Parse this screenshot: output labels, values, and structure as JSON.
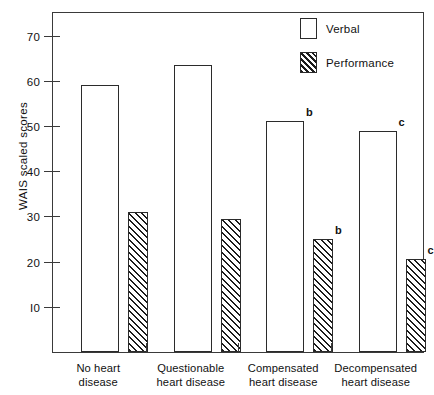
{
  "chart_data": {
    "type": "bar",
    "title": "",
    "xlabel": "",
    "ylabel": "WAIS  scaled  scores",
    "ylim": [
      0,
      75
    ],
    "yticks": [
      10,
      20,
      30,
      40,
      50,
      60,
      70
    ],
    "ytick_labels": [
      "I0",
      "20",
      "30",
      "40",
      "50",
      "60",
      "70"
    ],
    "grid": false,
    "legend_position": "top-right",
    "categories": [
      "No heart disease",
      "Questionable heart disease",
      "Compensated heart disease",
      "Decompensated heart disease"
    ],
    "category_lines": [
      [
        "No heart",
        "disease"
      ],
      [
        "Questionable",
        "heart disease"
      ],
      [
        "Compensated",
        "heart disease"
      ],
      [
        "Decompensated",
        "heart disease"
      ]
    ],
    "series": [
      {
        "name": "Verbal",
        "fill": "open",
        "values": [
          59,
          63.5,
          51,
          49
        ],
        "annotations": [
          "",
          "",
          "b",
          "c"
        ]
      },
      {
        "name": "Performance",
        "fill": "hatched",
        "values": [
          31,
          29.5,
          25,
          20.5
        ],
        "annotations": [
          "",
          "",
          "b",
          "c"
        ]
      }
    ]
  },
  "legend": {
    "items": [
      {
        "label": "Verbal",
        "swatch": "open-box-swatch"
      },
      {
        "label": "Performance",
        "swatch": "hatched-box-swatch"
      }
    ]
  },
  "colors": {
    "axis": "#3a3a3a",
    "bar_outline": "#2b2b2b",
    "hatch": "#1c1c1c",
    "background": "#ffffff"
  }
}
